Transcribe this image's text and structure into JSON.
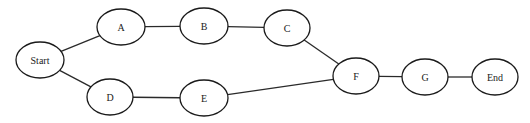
{
  "diagram": {
    "type": "network",
    "nodes": [
      {
        "id": "start",
        "label": "Start",
        "cx": 40,
        "cy": 60,
        "rx": 24,
        "ry": 18
      },
      {
        "id": "a",
        "label": "A",
        "cx": 121,
        "cy": 27,
        "rx": 24,
        "ry": 18
      },
      {
        "id": "b",
        "label": "B",
        "cx": 204,
        "cy": 26,
        "rx": 24,
        "ry": 18
      },
      {
        "id": "c",
        "label": "C",
        "cx": 287,
        "cy": 28,
        "rx": 23,
        "ry": 18
      },
      {
        "id": "d",
        "label": "D",
        "cx": 110,
        "cy": 97,
        "rx": 23,
        "ry": 18
      },
      {
        "id": "e",
        "label": "E",
        "cx": 204,
        "cy": 98,
        "rx": 24,
        "ry": 18
      },
      {
        "id": "f",
        "label": "F",
        "cx": 356,
        "cy": 76,
        "rx": 23,
        "ry": 18
      },
      {
        "id": "g",
        "label": "G",
        "cx": 425,
        "cy": 77,
        "rx": 23,
        "ry": 18
      },
      {
        "id": "end",
        "label": "End",
        "cx": 495,
        "cy": 77,
        "rx": 23,
        "ry": 18
      }
    ],
    "edges": [
      {
        "from": "start",
        "to": "a"
      },
      {
        "from": "a",
        "to": "b"
      },
      {
        "from": "b",
        "to": "c"
      },
      {
        "from": "c",
        "to": "f"
      },
      {
        "from": "start",
        "to": "d"
      },
      {
        "from": "d",
        "to": "e"
      },
      {
        "from": "e",
        "to": "f"
      },
      {
        "from": "f",
        "to": "g"
      },
      {
        "from": "g",
        "to": "end"
      }
    ]
  }
}
